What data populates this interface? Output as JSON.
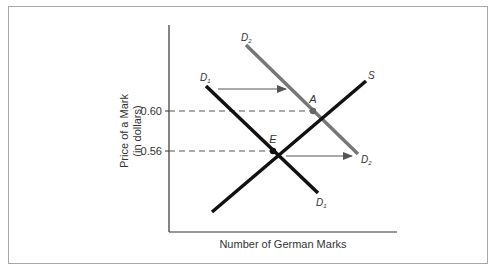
{
  "diagram": {
    "y_axis_label_line1": "Price of a Mark",
    "y_axis_label_line2": "(in dollars)",
    "x_axis_label": "Number of German Marks",
    "price_ticks": [
      {
        "label": "0.60",
        "value": 0.6
      },
      {
        "label": "0.56",
        "value": 0.56
      }
    ],
    "curves": {
      "d1": {
        "label": "D",
        "subscript": "1",
        "color": "#111111"
      },
      "d2": {
        "label": "D",
        "subscript": "2",
        "color": "#777777"
      },
      "s": {
        "label": "S",
        "color": "#111111"
      }
    },
    "points": {
      "a": {
        "label": "A",
        "price": 0.6,
        "color": "#666666"
      },
      "e": {
        "label": "E",
        "price": 0.56,
        "color": "#111111"
      }
    },
    "arrow_color": "#555555",
    "dash_color": "#555555",
    "axis_color": "#333333"
  }
}
